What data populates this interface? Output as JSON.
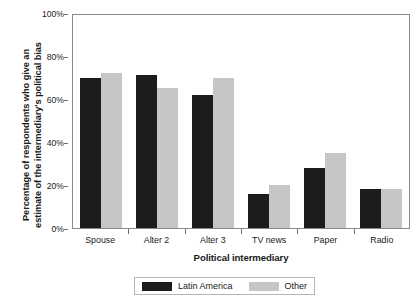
{
  "chart_data": {
    "type": "bar",
    "title": "",
    "xlabel": "Political intermediary",
    "ylabel_line1": "Percentage of respondents who give an",
    "ylabel_line2": "estimate of the intermediary's political bias",
    "categories": [
      "Spouse",
      "Alter 2",
      "Alter 3",
      "TV news",
      "Paper",
      "Radio"
    ],
    "series": [
      {
        "name": "Latin America",
        "color": "#1c1c1c",
        "values": [
          70,
          71,
          62,
          16,
          28,
          18
        ]
      },
      {
        "name": "Other",
        "color": "#c6c6c6",
        "values": [
          72,
          65,
          70,
          20,
          35,
          18
        ]
      }
    ],
    "ylim": [
      0,
      100
    ],
    "yticks": [
      0,
      20,
      40,
      60,
      80,
      100
    ],
    "ytick_labels": [
      "0%",
      "20%",
      "40%",
      "60%",
      "80%",
      "100%"
    ],
    "grid": false,
    "legend_position": "bottom"
  },
  "legend": {
    "entries": [
      {
        "label": "Latin America"
      },
      {
        "label": "Other"
      }
    ]
  }
}
